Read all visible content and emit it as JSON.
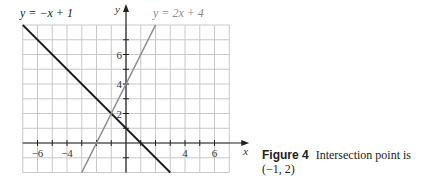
{
  "chart_data": {
    "type": "line",
    "title": "",
    "xlabel": "x",
    "ylabel": "y",
    "xlim": [
      -7,
      7
    ],
    "ylim": [
      -2,
      8
    ],
    "grid": true,
    "x_ticks": [
      -6,
      -4,
      4,
      6
    ],
    "y_ticks": [
      2,
      4,
      6
    ],
    "series": [
      {
        "name": "y = −x + 1",
        "color": "#1a1a1a",
        "equation": "y = -x + 1",
        "x": [
          -7,
          3
        ],
        "y": [
          8,
          -2
        ]
      },
      {
        "name": "y = 2x + 4",
        "color": "#8c8c8c",
        "equation": "y = 2x + 4",
        "x": [
          -3,
          2
        ],
        "y": [
          -2,
          8
        ]
      }
    ],
    "annotations": [
      {
        "text": "Intersection point (−1, 2)",
        "x": -1,
        "y": 2
      }
    ]
  },
  "labels": {
    "line1": "y = −x + 1",
    "line2": "y = 2x + 4",
    "xaxis": "x",
    "yaxis": "y"
  },
  "caption": {
    "figure": "Figure 4",
    "text": "Intersection point is (−1, 2)"
  }
}
